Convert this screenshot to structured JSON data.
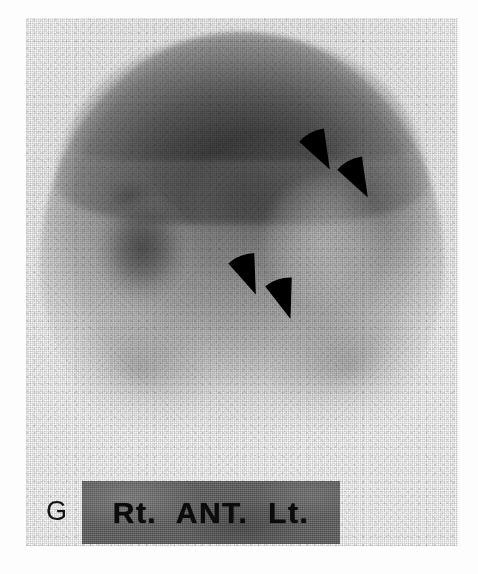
{
  "figure": {
    "modality": "scintigraphy",
    "film_letter": "G",
    "orientation_label": "Rt.  ANT.  Lt.",
    "orientation_parts": {
      "right": "Rt.",
      "view": "ANT.",
      "left": "Lt."
    },
    "marker_count": 4,
    "marker_shape": "arrowhead"
  },
  "colors": {
    "page_background": "#ffffff",
    "label_bar_background": "#6b6b6b",
    "label_text": "#0b0b0b",
    "film_letter": "#151515",
    "marker": "#000000",
    "film_base": "#f4f4f4"
  },
  "scan": {
    "region": {
      "x": 26,
      "y": 18,
      "width": 432,
      "height": 528
    },
    "description": "anterior planar radionuclide image with dome-shaped tracer distribution"
  },
  "markers": [
    {
      "id": "arrowhead-1",
      "x": 303,
      "y": 130,
      "size": 34,
      "rotation": -28
    },
    {
      "id": "arrowhead-2",
      "x": 341,
      "y": 158,
      "size": 34,
      "rotation": -28
    },
    {
      "id": "arrowhead-3",
      "x": 231,
      "y": 254,
      "size": 34,
      "rotation": -22
    },
    {
      "id": "arrowhead-4",
      "x": 267,
      "y": 278,
      "size": 34,
      "rotation": -18
    }
  ]
}
